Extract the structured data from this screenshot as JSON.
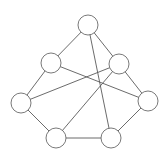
{
  "diagram": {
    "type": "graph",
    "directed": false,
    "node_radius": 10,
    "colors": {
      "background": "#ffffff",
      "edge": "#5a5a5a",
      "node_stroke": "#6a6a6a",
      "node_fill": "#ffffff"
    },
    "nodes": [
      {
        "id": "top",
        "x": 88,
        "y": 25
      },
      {
        "id": "upper-left",
        "x": 51,
        "y": 63
      },
      {
        "id": "upper-right",
        "x": 119,
        "y": 64
      },
      {
        "id": "left",
        "x": 21,
        "y": 103
      },
      {
        "id": "right",
        "x": 148,
        "y": 101
      },
      {
        "id": "bottom-left",
        "x": 56,
        "y": 138
      },
      {
        "id": "bottom-right",
        "x": 111,
        "y": 138
      }
    ],
    "edges": [
      [
        "top",
        "upper-left"
      ],
      [
        "top",
        "upper-right"
      ],
      [
        "top",
        "bottom-right"
      ],
      [
        "upper-left",
        "left"
      ],
      [
        "upper-left",
        "right"
      ],
      [
        "upper-right",
        "left"
      ],
      [
        "upper-right",
        "right"
      ],
      [
        "upper-right",
        "bottom-left"
      ],
      [
        "left",
        "bottom-left"
      ],
      [
        "bottom-left",
        "bottom-right"
      ],
      [
        "bottom-right",
        "right"
      ]
    ]
  }
}
